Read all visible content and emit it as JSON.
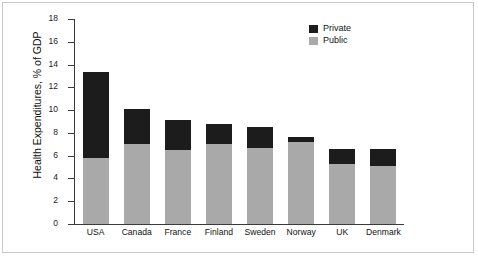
{
  "chart_data": {
    "type": "bar",
    "stacked": true,
    "title": "",
    "xlabel": "",
    "ylabel": "Health Expenditures, % of GDP",
    "ylim": [
      0,
      18
    ],
    "yticks": [
      0,
      2,
      4,
      6,
      8,
      10,
      12,
      14,
      16,
      18
    ],
    "ytick_labels": [
      "0",
      "2",
      "4",
      "6",
      "8",
      "10",
      "12",
      "14",
      "16",
      "18"
    ],
    "grid": false,
    "legend_position": "top-right",
    "categories": [
      "USA",
      "Canada",
      "France",
      "Finland",
      "Sweden",
      "Norway",
      "UK",
      "Denmark"
    ],
    "series": [
      {
        "name": "Public",
        "color": "#a9a9a9",
        "values": [
          5.8,
          7.0,
          6.5,
          7.05,
          6.65,
          7.2,
          5.3,
          5.1
        ]
      },
      {
        "name": "Private",
        "color": "#1c1c1c",
        "values": [
          7.55,
          3.1,
          2.6,
          1.75,
          1.85,
          0.45,
          1.3,
          1.5
        ]
      }
    ],
    "totals": [
      13.35,
      10.1,
      9.1,
      8.8,
      8.5,
      7.65,
      6.6,
      6.6
    ]
  },
  "legend": {
    "entries": [
      {
        "label": "Private",
        "color": "#1c1c1c"
      },
      {
        "label": "Public",
        "color": "#a9a9a9"
      }
    ]
  }
}
